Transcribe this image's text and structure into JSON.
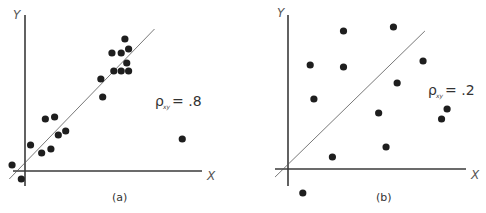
{
  "chart_data": [
    {
      "type": "scatter",
      "panel_label": "(a)",
      "xlabel": "X",
      "ylabel": "Y",
      "annotation": {
        "symbol": "ρ",
        "subscript": "xy",
        "text": "= .8"
      },
      "correlation": 0.8,
      "xlim": [
        -0.8,
        10
      ],
      "ylim": [
        -0.4,
        8
      ],
      "grid": false,
      "fit_line": {
        "from": [
          -0.85,
          -0.4
        ],
        "to": [
          7.0,
          7.1
        ]
      },
      "points": [
        {
          "x": 5.4,
          "y": 6.6
        },
        {
          "x": 4.7,
          "y": 5.9
        },
        {
          "x": 5.2,
          "y": 5.9
        },
        {
          "x": 5.6,
          "y": 6.1
        },
        {
          "x": 5.5,
          "y": 5.4
        },
        {
          "x": 4.8,
          "y": 5.0
        },
        {
          "x": 5.2,
          "y": 5.0
        },
        {
          "x": 5.6,
          "y": 5.0
        },
        {
          "x": 4.1,
          "y": 4.6
        },
        {
          "x": 4.2,
          "y": 3.7
        },
        {
          "x": 1.1,
          "y": 2.6
        },
        {
          "x": 1.6,
          "y": 2.7
        },
        {
          "x": 1.8,
          "y": 1.8
        },
        {
          "x": 2.2,
          "y": 2.0
        },
        {
          "x": 0.3,
          "y": 1.3
        },
        {
          "x": 0.9,
          "y": 0.9
        },
        {
          "x": 1.4,
          "y": 1.1
        },
        {
          "x": -0.7,
          "y": 0.3
        },
        {
          "x": -0.2,
          "y": -0.4
        },
        {
          "x": 8.5,
          "y": 1.6
        }
      ]
    },
    {
      "type": "scatter",
      "panel_label": "(b)",
      "xlabel": "X",
      "ylabel": "Y",
      "annotation": {
        "symbol": "ρ",
        "subscript": "xy",
        "text": "= .2"
      },
      "correlation": 0.2,
      "xlim": [
        -0.8,
        10
      ],
      "ylim": [
        -1.2,
        8
      ],
      "grid": false,
      "fit_line": {
        "from": [
          -0.7,
          -0.4
        ],
        "to": [
          7.4,
          6.9
        ]
      },
      "points": [
        {
          "x": 3.0,
          "y": 6.9
        },
        {
          "x": 5.7,
          "y": 7.1
        },
        {
          "x": 1.2,
          "y": 5.2
        },
        {
          "x": 3.0,
          "y": 5.1
        },
        {
          "x": 7.3,
          "y": 5.4
        },
        {
          "x": 5.9,
          "y": 4.3
        },
        {
          "x": 1.4,
          "y": 3.5
        },
        {
          "x": 4.9,
          "y": 2.8
        },
        {
          "x": 8.6,
          "y": 3.0
        },
        {
          "x": 8.3,
          "y": 2.5
        },
        {
          "x": 5.3,
          "y": 1.1
        },
        {
          "x": 2.4,
          "y": 0.6
        },
        {
          "x": 0.8,
          "y": -1.2
        }
      ]
    }
  ]
}
